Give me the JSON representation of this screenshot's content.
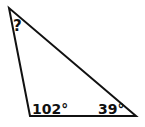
{
  "diagram": {
    "type": "triangle",
    "vertices": {
      "top": {
        "x": 9,
        "y": 8
      },
      "bottom_left": {
        "x": 30,
        "y": 116
      },
      "bottom_right": {
        "x": 136,
        "y": 116
      }
    },
    "angles": {
      "top": "?",
      "bottom_left": "102°",
      "bottom_right": "39°"
    },
    "stroke_color": "#111111",
    "background": "#ffffff"
  }
}
